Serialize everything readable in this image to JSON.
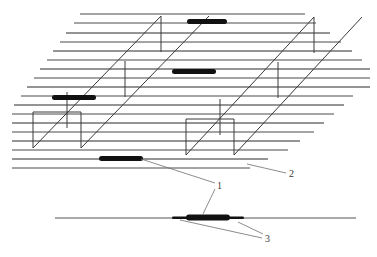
{
  "figure": {
    "domain_type": "line-diagram",
    "background_color": "#ffffff",
    "line_color": "#3a3a3a",
    "bar_color": "#111111",
    "leader_color": "#6e6e6e"
  },
  "labels": [
    {
      "id": "label-1",
      "text": "1",
      "x": 219,
      "y": 186,
      "refers_to": "black bar element"
    },
    {
      "id": "label-2",
      "text": "2",
      "x": 290,
      "y": 174,
      "refers_to": "lined surface region"
    },
    {
      "id": "label-3",
      "text": "3",
      "x": 266,
      "y": 239,
      "refers_to": "cross-section detail segments"
    }
  ],
  "bars": [
    {
      "name": "bar-top",
      "x": 187,
      "y": 19,
      "w": 40,
      "h": 5
    },
    {
      "name": "bar-middle",
      "x": 172,
      "y": 69,
      "w": 44,
      "h": 5
    },
    {
      "name": "bar-left",
      "x": 52,
      "y": 95,
      "w": 44,
      "h": 5
    },
    {
      "name": "bar-lower",
      "x": 99,
      "y": 156,
      "w": 44,
      "h": 5
    }
  ],
  "detail": {
    "baseline": {
      "x1": 55,
      "x2": 356,
      "y": 218
    },
    "center_bar": {
      "x": 186,
      "y": 215,
      "w": 44,
      "h": 6
    },
    "left_segment": {
      "x": 172,
      "y": 216,
      "w": 16,
      "h": 3
    },
    "right_segment": {
      "x": 228,
      "y": 216,
      "w": 16,
      "h": 3
    }
  },
  "hatch_lines": {
    "count": 17,
    "description": "parallel horizontal rules whose left and right ends are staggered along the diagonal channel edges",
    "spacing_px": 9,
    "top_y": 14,
    "color": "#4a4a4a"
  },
  "channels": [
    {
      "name": "channel-left",
      "description": "diagonal parallelogram trench, upper-left structure",
      "top_rail": {
        "x1": 33,
        "y1": 148,
        "x2": 161,
        "y2": 16
      },
      "bottom_rail": {
        "x1": 33,
        "y1": 148,
        "x2": 162,
        "y2": 16
      },
      "front_face_offset_x": 48,
      "front_face_offset_y": 43
    },
    {
      "name": "channel-right",
      "description": "diagonal parallelogram trench, lower-right structure",
      "top_rail": {
        "x1": 186,
        "y1": 155,
        "x2": 314,
        "y2": 17
      },
      "front_face_offset_x": 48,
      "front_face_offset_y": 43
    }
  ]
}
